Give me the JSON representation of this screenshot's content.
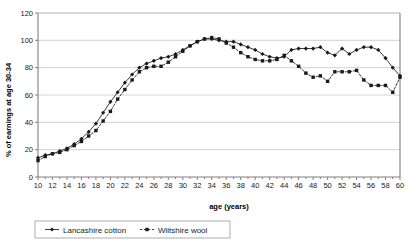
{
  "chart_data": {
    "type": "line",
    "title": "",
    "xlabel": "age (years)",
    "ylabel": "% of earnings at age 30-34",
    "xlim": [
      10,
      60
    ],
    "ylim": [
      0,
      120
    ],
    "ytick_step": 20,
    "xtick_label_step": 2,
    "xtick_step": 1,
    "grid": true,
    "legend_position": "bottom",
    "yticks": [
      "0",
      "20",
      "40",
      "60",
      "80",
      "100",
      "120"
    ],
    "xticks": [
      "10",
      "12",
      "14",
      "16",
      "18",
      "20",
      "22",
      "24",
      "26",
      "28",
      "30",
      "32",
      "34",
      "36",
      "38",
      "40",
      "42",
      "44",
      "46",
      "48",
      "50",
      "52",
      "54",
      "56",
      "58",
      "60"
    ],
    "x": [
      10,
      11,
      12,
      13,
      14,
      15,
      16,
      17,
      18,
      19,
      20,
      21,
      22,
      23,
      24,
      25,
      26,
      27,
      28,
      29,
      30,
      31,
      32,
      33,
      34,
      35,
      36,
      37,
      38,
      39,
      40,
      41,
      42,
      43,
      44,
      45,
      46,
      47,
      48,
      49,
      50,
      51,
      52,
      53,
      54,
      55,
      56,
      57,
      58,
      59,
      60
    ],
    "series": [
      {
        "name": "Lancashire cotton",
        "marker": "diamond",
        "dash": "solid",
        "color": "#1a1a1a",
        "values": [
          14,
          16,
          17,
          19,
          21,
          24,
          28,
          33,
          39,
          47,
          55,
          62,
          69,
          75,
          80,
          83,
          85,
          87,
          88,
          90,
          93,
          96,
          99,
          101,
          101,
          100,
          99,
          99,
          97,
          95,
          93,
          90,
          88,
          87,
          88,
          93,
          94,
          94,
          94,
          95,
          91,
          89,
          94,
          90,
          93,
          95,
          95,
          93,
          87,
          80,
          74
        ]
      },
      {
        "name": "Wiltshire wool",
        "marker": "square",
        "dash": "dashed",
        "color": "#1a1a1a",
        "values": [
          12,
          15,
          17,
          18,
          20,
          23,
          26,
          30,
          34,
          41,
          48,
          57,
          64,
          71,
          77,
          80,
          81,
          81,
          84,
          88,
          92,
          96,
          99,
          101,
          102,
          101,
          98,
          95,
          91,
          88,
          86,
          85,
          85,
          86,
          89,
          85,
          81,
          76,
          73,
          74,
          70,
          77,
          77,
          77,
          78,
          71,
          67,
          67,
          67,
          62,
          73
        ]
      }
    ]
  },
  "legend": {
    "items": [
      {
        "label": "Lancashire cotton"
      },
      {
        "label": "Wiltshire wool"
      }
    ]
  },
  "axes": {
    "x_title": "age (years)",
    "y_title": "% of earnings at age 30-34"
  },
  "colors": {
    "line": "#1a1a1a",
    "grid": "#b5b5b5",
    "axis": "#808080",
    "background": "#ffffff"
  }
}
